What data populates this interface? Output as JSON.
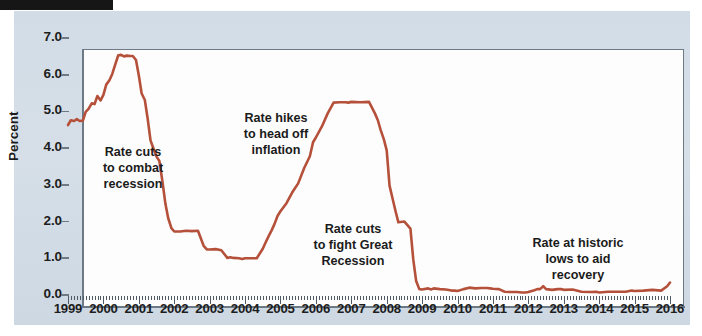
{
  "figure": {
    "tab_label": "",
    "background_color": "#d4dde7",
    "plot_background_color": "#fdfdfd",
    "axis_color": "#6d7a86",
    "line_color": "#b5503a"
  },
  "chart_data": {
    "type": "line",
    "title": "",
    "subtitle": "",
    "xlabel": "",
    "ylabel": "Percent",
    "xlim": [
      1999.0,
      2016.0
    ],
    "ylim": [
      0.0,
      7.0
    ],
    "grid": false,
    "legend": "none",
    "ytick_labels": [
      "0.0",
      "1.0",
      "2.0",
      "3.0",
      "4.0",
      "5.0",
      "6.0",
      "7.0"
    ],
    "ytick_values": [
      0.0,
      1.0,
      2.0,
      3.0,
      4.0,
      5.0,
      6.0,
      7.0
    ],
    "xtick_labels": [
      "1999",
      "2000",
      "2001",
      "2002",
      "2003",
      "2004",
      "2005",
      "2006",
      "2007",
      "2008",
      "2009",
      "2010",
      "2011",
      "2012",
      "2013",
      "2014",
      "2015",
      "2016"
    ],
    "xtick_values": [
      1999,
      2000,
      2001,
      2002,
      2003,
      2004,
      2005,
      2006,
      2007,
      2008,
      2009,
      2010,
      2011,
      2012,
      2013,
      2014,
      2015,
      2016
    ],
    "series": [
      {
        "name": "Federal funds rate",
        "color": "#b5503a",
        "x": [
          1999.0,
          1999.08,
          1999.17,
          1999.25,
          1999.33,
          1999.42,
          1999.5,
          1999.58,
          1999.67,
          1999.75,
          1999.83,
          1999.92,
          2000.0,
          2000.08,
          2000.17,
          2000.25,
          2000.33,
          2000.42,
          2000.5,
          2000.58,
          2000.67,
          2000.75,
          2000.83,
          2000.92,
          2001.0,
          2001.08,
          2001.17,
          2001.25,
          2001.33,
          2001.42,
          2001.5,
          2001.58,
          2001.67,
          2001.75,
          2001.83,
          2001.92,
          2002.0,
          2002.17,
          2002.33,
          2002.5,
          2002.67,
          2002.83,
          2002.92,
          2003.0,
          2003.17,
          2003.33,
          2003.5,
          2003.58,
          2003.67,
          2003.83,
          2003.92,
          2004.0,
          2004.17,
          2004.33,
          2004.5,
          2004.58,
          2004.67,
          2004.75,
          2004.83,
          2004.92,
          2005.0,
          2005.17,
          2005.33,
          2005.5,
          2005.67,
          2005.83,
          2005.92,
          2006.0,
          2006.17,
          2006.33,
          2006.5,
          2006.67,
          2006.83,
          2006.92,
          2007.0,
          2007.25,
          2007.5,
          2007.67,
          2007.75,
          2007.83,
          2007.92,
          2008.0,
          2008.08,
          2008.17,
          2008.25,
          2008.33,
          2008.5,
          2008.67,
          2008.75,
          2008.83,
          2008.92,
          2009.0,
          2009.17,
          2009.25,
          2009.33,
          2009.5,
          2009.67,
          2009.83,
          2009.92,
          2010.0,
          2010.17,
          2010.33,
          2010.5,
          2010.67,
          2010.83,
          2010.92,
          2011.0,
          2011.17,
          2011.33,
          2011.5,
          2011.67,
          2011.83,
          2011.92,
          2012.0,
          2012.17,
          2012.25,
          2012.33,
          2012.42,
          2012.5,
          2012.67,
          2012.83,
          2012.92,
          2013.0,
          2013.25,
          2013.5,
          2013.75,
          2013.92,
          2014.0,
          2014.25,
          2014.5,
          2014.75,
          2014.92,
          2015.0,
          2015.25,
          2015.5,
          2015.75,
          2015.92,
          2016.0
        ],
        "y": [
          4.63,
          4.76,
          4.74,
          4.79,
          4.74,
          4.75,
          4.99,
          5.07,
          5.22,
          5.2,
          5.42,
          5.3,
          5.45,
          5.73,
          5.85,
          6.02,
          6.27,
          6.53,
          6.54,
          6.5,
          6.52,
          6.51,
          6.51,
          6.4,
          5.98,
          5.49,
          5.31,
          4.8,
          4.21,
          3.97,
          3.77,
          3.65,
          3.07,
          2.49,
          2.09,
          1.82,
          1.73,
          1.73,
          1.75,
          1.74,
          1.75,
          1.34,
          1.24,
          1.24,
          1.25,
          1.22,
          1.01,
          1.03,
          1.01,
          1.0,
          0.98,
          1.0,
          1.0,
          1.0,
          1.26,
          1.43,
          1.61,
          1.76,
          1.93,
          2.16,
          2.28,
          2.5,
          2.79,
          3.04,
          3.46,
          3.78,
          4.16,
          4.29,
          4.59,
          4.94,
          5.24,
          5.25,
          5.25,
          5.24,
          5.26,
          5.25,
          5.26,
          4.94,
          4.76,
          4.49,
          4.24,
          3.94,
          2.98,
          2.61,
          2.28,
          1.98,
          2.0,
          1.81,
          0.97,
          0.39,
          0.16,
          0.15,
          0.18,
          0.15,
          0.18,
          0.16,
          0.15,
          0.12,
          0.12,
          0.11,
          0.16,
          0.2,
          0.18,
          0.19,
          0.19,
          0.18,
          0.17,
          0.16,
          0.09,
          0.08,
          0.08,
          0.07,
          0.07,
          0.08,
          0.13,
          0.16,
          0.16,
          0.24,
          0.16,
          0.14,
          0.16,
          0.16,
          0.14,
          0.15,
          0.09,
          0.08,
          0.09,
          0.07,
          0.09,
          0.09,
          0.09,
          0.12,
          0.11,
          0.12,
          0.14,
          0.12,
          0.24,
          0.34
        ]
      }
    ],
    "annotations": [
      {
        "id": "rate-cuts-recession",
        "text": "Rate cuts\nto combat\nrecession",
        "x_px": 88,
        "y_px": 144,
        "width_px": 90
      },
      {
        "id": "rate-hikes-inflation",
        "text": "Rate hikes\nto head off\ninflation",
        "x_px": 231,
        "y_px": 110,
        "width_px": 90
      },
      {
        "id": "rate-cuts-great-recession",
        "text": "Rate cuts\nto fight Great\nRecession",
        "x_px": 303,
        "y_px": 221,
        "width_px": 100
      },
      {
        "id": "rate-historic-lows",
        "text": "Rate at historic\nlows to aid\nrecovery",
        "x_px": 526,
        "y_px": 235,
        "width_px": 104
      }
    ]
  }
}
